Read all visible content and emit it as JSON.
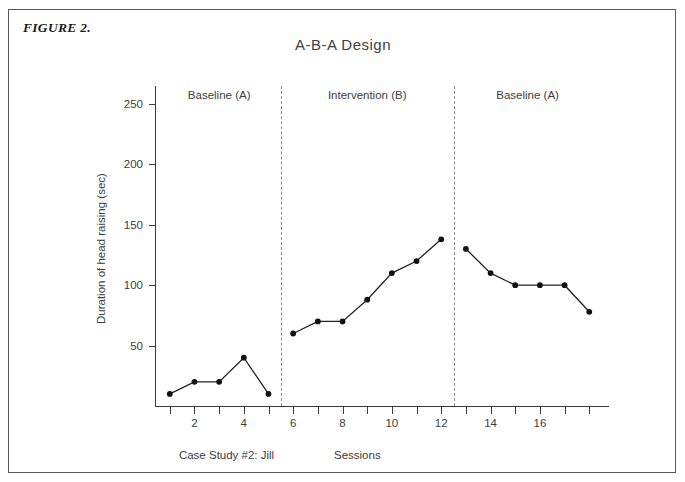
{
  "figure": {
    "label": "FIGURE 2.",
    "caption_left": "Case Study #2: Jill"
  },
  "chart_data": {
    "type": "line",
    "title": "A-B-A Design",
    "xlabel": "Sessions",
    "ylabel": "Duration of head raising (sec)",
    "xlim": [
      0.4,
      18.8
    ],
    "ylim": [
      0,
      270
    ],
    "grid": false,
    "legend": "none",
    "x": [
      1,
      2,
      3,
      4,
      5,
      6,
      7,
      8,
      9,
      10,
      11,
      12,
      13,
      14,
      15,
      16,
      17,
      18
    ],
    "values": [
      10,
      20,
      20,
      40,
      10,
      60,
      70,
      70,
      88,
      110,
      120,
      138,
      130,
      110,
      100,
      100,
      100,
      78
    ],
    "series": [
      {
        "name": "Duration of head raising (sec)",
        "values": [
          10,
          20,
          20,
          40,
          10,
          60,
          70,
          70,
          88,
          110,
          120,
          138,
          130,
          110,
          100,
          100,
          100,
          78
        ]
      }
    ],
    "yticks": [
      50,
      100,
      150,
      200,
      250
    ],
    "ytick_labels": [
      "50",
      "100",
      "150",
      "200",
      "250"
    ],
    "xticks": [
      1,
      2,
      3,
      4,
      5,
      6,
      7,
      8,
      9,
      10,
      11,
      12,
      13,
      14,
      15,
      16,
      17,
      18
    ],
    "xtick_labels": [
      "2",
      "4",
      "6",
      "8",
      "10",
      "12",
      "14",
      "16"
    ],
    "xtick_label_values": [
      2,
      4,
      6,
      8,
      10,
      12,
      14,
      16
    ],
    "phases": [
      {
        "label": "Baseline (A)",
        "center_x": 3.0,
        "start_x": 1,
        "end_x": 5
      },
      {
        "label": "Intervention (B)",
        "center_x": 9.0,
        "start_x": 6,
        "end_x": 12
      },
      {
        "label": "Baseline (A)",
        "center_x": 15.5,
        "start_x": 13,
        "end_x": 18
      }
    ],
    "phase_dividers": [
      5.5,
      12.5
    ],
    "annotations": [
      "Case Study #2: Jill"
    ],
    "colors": {
      "line": "#222222",
      "marker": "#111111",
      "axis": "#3a3a3a",
      "divider": "#8c8c8c",
      "text": "#3d3d3d",
      "frame": "#5a5a5a",
      "background": "#ffffff"
    }
  }
}
